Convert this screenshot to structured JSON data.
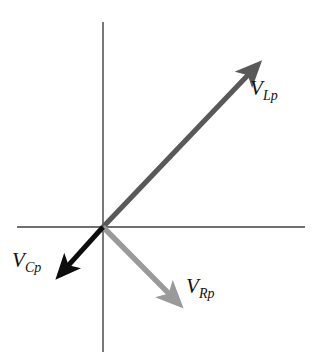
{
  "figure": {
    "type": "phasor-diagram",
    "background_color": "#ffffff",
    "width": 323,
    "height": 360
  },
  "axes": {
    "origin": {
      "x": 103,
      "y": 227
    },
    "color": "#3f3f3f",
    "stroke_width": 1.4,
    "horizontal": {
      "name": "horizontal-axis",
      "x1": 17,
      "y1": 227,
      "x2": 305,
      "y2": 227
    },
    "vertical": {
      "name": "vertical-axis",
      "x1": 103,
      "y1": 22,
      "x2": 103,
      "y2": 352
    }
  },
  "vectors": [
    {
      "id": "vlp",
      "label_base": "V",
      "label_sub": "Lp",
      "color": "#595959",
      "stroke_width": 5.2,
      "tip": {
        "x": 270,
        "y": 52
      },
      "angle_deg": 46,
      "label_position": {
        "x": 250,
        "y": 78
      }
    },
    {
      "id": "vrp",
      "label_base": "V",
      "label_sub": "Rp",
      "color": "#9a9a9a",
      "stroke_width": 5.4,
      "tip": {
        "x": 192,
        "y": 317
      },
      "angle_deg": -47,
      "label_position": {
        "x": 186,
        "y": 276
      }
    },
    {
      "id": "vcp",
      "label_base": "V",
      "label_sub": "Cp",
      "color": "#0d0d0d",
      "stroke_width": 5.0,
      "tip": {
        "x": 48,
        "y": 288
      },
      "angle_deg": -130,
      "label_position": {
        "x": 12,
        "y": 250
      }
    }
  ],
  "chart_data": {
    "type": "scatter",
    "title": "",
    "xlabel": "",
    "ylabel": "",
    "grid": false,
    "legend": "none",
    "series": [
      {
        "name": "V_Lp",
        "label": "VLp",
        "angle_deg": 46,
        "magnitude_px": 242,
        "color": "#595959"
      },
      {
        "name": "V_Rp",
        "label": "VRp",
        "angle_deg": -47,
        "magnitude_px": 130,
        "color": "#9a9a9a"
      },
      {
        "name": "V_Cp",
        "label": "VCp",
        "angle_deg": -130,
        "magnitude_px": 83,
        "color": "#0d0d0d"
      }
    ]
  }
}
